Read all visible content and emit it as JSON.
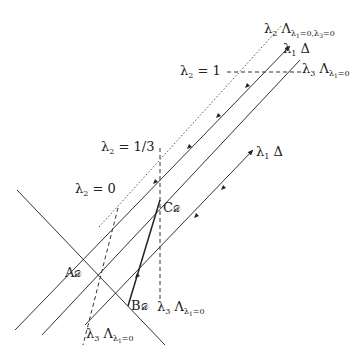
{
  "diagram": {
    "labels": {
      "top_dotted": {
        "lambda": "λ",
        "idx": "2",
        "Lambda": "Λ",
        "sub": "λ",
        "sub_idx": "1",
        "cond": "=0,λ",
        "cond_idx": "3",
        "cond2": "=0"
      },
      "top_delta": {
        "lambda": "λ",
        "idx": "1",
        "delta": "Δ"
      },
      "top_right_lambda": {
        "lambda": "λ",
        "idx": "3",
        "Lambda": "Λ",
        "sub": "λ",
        "sub_idx": "1",
        "cond": "=0"
      },
      "lambda2_eq_1": {
        "lambda": "λ",
        "idx": "2",
        "eq": "= 1"
      },
      "lambda2_eq_1_3": {
        "lambda": "λ",
        "idx": "2",
        "eq": "= 1/3"
      },
      "lambda2_eq_0": {
        "lambda": "λ",
        "idx": "2",
        "eq": "= 0"
      },
      "right_delta": {
        "lambda": "λ",
        "idx": "1",
        "delta": "Δ"
      },
      "point_C": {
        "letter": "C",
        "sub": "𝒟"
      },
      "point_A": {
        "letter": "A",
        "sub": "𝒟"
      },
      "point_B": {
        "letter": "B",
        "sub": "𝒟"
      },
      "bottom_mid": {
        "lambda": "λ",
        "idx": "3",
        "Lambda": "Λ",
        "sub": "λ",
        "sub_idx": "1",
        "cond": "=0"
      },
      "bottom_left": {
        "lambda": "λ",
        "idx": "3",
        "Lambda": "Λ",
        "sub": "λ",
        "sub_idx": "1",
        "cond": "=0"
      }
    },
    "colors": {
      "line": "#333333",
      "background": "#ffffff"
    }
  }
}
